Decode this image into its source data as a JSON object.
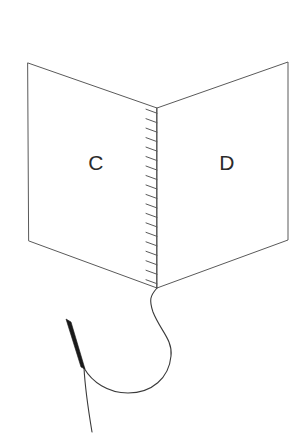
{
  "figure": {
    "kind": "line-diagram",
    "background_color": "#ffffff",
    "stroke_color": "#5a5a5a",
    "thread_color": "#3a3a3a",
    "needle_color": "#1a1a1a",
    "label_color": "#2b2b2b"
  },
  "labels": {
    "left_page": "C",
    "right_page": "D"
  },
  "geometry": {
    "left_page": {
      "top_outer_x": 28,
      "top_outer_y": 63,
      "bottom_outer_x": 29,
      "bottom_outer_y": 241,
      "top_spine_x": 157,
      "top_spine_y": 108,
      "bottom_spine_x": 157,
      "bottom_spine_y": 288
    },
    "right_page": {
      "top_outer_x": 288,
      "top_outer_y": 62,
      "bottom_outer_x": 288,
      "bottom_outer_y": 240,
      "top_spine_x": 157,
      "top_spine_y": 108,
      "bottom_spine_x": 157,
      "bottom_spine_y": 288
    },
    "spine": {
      "top_x": 157,
      "top_y": 108,
      "bottom_x": 157,
      "bottom_y": 288,
      "stitch_count": 19,
      "stitch_length": 11,
      "stitch_rise": 4
    },
    "label_positions": {
      "left_page_x": 96,
      "left_page_y": 162,
      "right_page_x": 227,
      "right_page_y": 162
    },
    "needle": {
      "head_x": 68,
      "head_y": 321,
      "tip_x": 84,
      "tip_y": 368,
      "width": 5
    },
    "thread": {
      "spine_exit_x": 157,
      "spine_exit_y": 288,
      "loop_right_x": 171,
      "loop_right_y": 350,
      "loop_bottom_x": 123,
      "loop_bottom_y": 392,
      "needle_tip_x": 84,
      "needle_tip_y": 368,
      "tail_end_x": 92,
      "tail_end_y": 432
    }
  }
}
